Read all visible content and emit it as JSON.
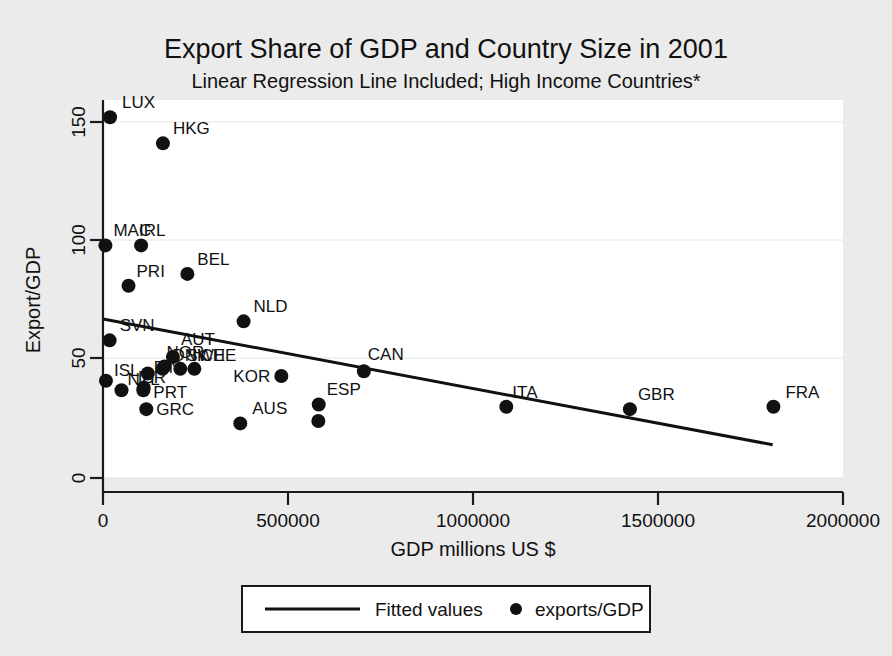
{
  "chart_data": {
    "type": "scatter",
    "title": "Export Share of GDP and Country Size in 2001",
    "subtitle": "Linear Regression Line Included; High Income Countries*",
    "xlabel": "GDP millions US $",
    "ylabel": "Export/GDP",
    "xlim": [
      0,
      2000000
    ],
    "ylim": [
      0,
      160
    ],
    "xticks": [
      0,
      500000,
      1000000,
      1500000,
      2000000
    ],
    "xticklabels": [
      "0",
      "500000",
      "1000000",
      "1500000",
      "2000000"
    ],
    "yticks": [
      0,
      50,
      100,
      150
    ],
    "yticklabels": [
      "0",
      "50",
      "100",
      "150"
    ],
    "grid": true,
    "legend_position": "below",
    "legend": [
      {
        "label": "Fitted values",
        "marker": "line"
      },
      {
        "label": "exports/GDP",
        "marker": "dot"
      }
    ],
    "series": [
      {
        "name": "exports/GDP",
        "marker": "dot",
        "points": [
          {
            "label": "LUX",
            "x": 19000,
            "y": 152,
            "label_dx": 12,
            "label_dy": -9
          },
          {
            "label": "HKG",
            "x": 162000,
            "y": 141,
            "label_dx": 10,
            "label_dy": -9
          },
          {
            "label": "MAC",
            "x": 6500,
            "y": 98,
            "label_dx": 8,
            "label_dy": -9
          },
          {
            "label": "IRL",
            "x": 103000,
            "y": 98,
            "label_dx": -2,
            "label_dy": -9
          },
          {
            "label": "PRI",
            "x": 69000,
            "y": 81,
            "label_dx": 8,
            "label_dy": -9
          },
          {
            "label": "BEL",
            "x": 228000,
            "y": 86,
            "label_dx": 10,
            "label_dy": -9
          },
          {
            "label": "NLD",
            "x": 380000,
            "y": 66,
            "label_dx": 10,
            "label_dy": -9
          },
          {
            "label": "SVN",
            "x": 18000,
            "y": 58,
            "label_dx": 10,
            "label_dy": -9
          },
          {
            "label": "AUT",
            "x": 189000,
            "y": 51,
            "label_dx": 8,
            "label_dy": -12
          },
          {
            "label": "NOR",
            "x": 166000,
            "y": 47,
            "label_dx": 2,
            "label_dy": -8
          },
          {
            "label": "DNK",
            "x": 161000,
            "y": 46,
            "label_dx": 10,
            "label_dy": -8
          },
          {
            "label": "SWE",
            "x": 209000,
            "y": 46,
            "label_dx": 6,
            "label_dy": -8
          },
          {
            "label": "CHE",
            "x": 247000,
            "y": 46,
            "label_dx": 6,
            "label_dy": -8
          },
          {
            "label": "FIN",
            "x": 121000,
            "y": 44,
            "label_dx": 6,
            "label_dy": -1
          },
          {
            "label": "ISL",
            "x": 8000,
            "y": 41,
            "label_dx": 8,
            "label_dy": -5
          },
          {
            "label": "NZL",
            "x": 50000,
            "y": 37,
            "label_dx": 6,
            "label_dy": -5
          },
          {
            "label": "ISR",
            "x": 110000,
            "y": 38,
            "label_dx": -6,
            "label_dy": -5
          },
          {
            "label": "PRT",
            "x": 109000,
            "y": 37,
            "label_dx": 10,
            "label_dy": 8
          },
          {
            "label": "GRC",
            "x": 117000,
            "y": 29,
            "label_dx": 10,
            "label_dy": 6
          },
          {
            "label": "ESP",
            "x": 582000,
            "y": 24,
            "label_dx": 0,
            "label_dy": 0
          },
          {
            "label": "KOR",
            "x": 482000,
            "y": 43,
            "label_dx": -48,
            "label_dy": 6
          },
          {
            "label": "CAN",
            "x": 705000,
            "y": 45,
            "label_dx": 4,
            "label_dy": -11
          },
          {
            "label": "AUS",
            "x": 371000,
            "y": 23,
            "label_dx": 12,
            "label_dy": -9
          },
          {
            "label": "ESP2",
            "x": 583000,
            "y": 31,
            "label_dx": 8,
            "label_dy": -9
          },
          {
            "label": "ITA",
            "x": 1090000,
            "y": 30,
            "label_dx": 6,
            "label_dy": -9
          },
          {
            "label": "GBR",
            "x": 1424000,
            "y": 29,
            "label_dx": 8,
            "label_dy": -9
          },
          {
            "label": "FRA",
            "x": 1812000,
            "y": 30,
            "label_dx": 12,
            "label_dy": -9
          }
        ]
      },
      {
        "name": "Fitted values",
        "marker": "line",
        "line": {
          "x0": 0,
          "y0": 67,
          "x1": 1810000,
          "y1": 14
        }
      }
    ]
  }
}
